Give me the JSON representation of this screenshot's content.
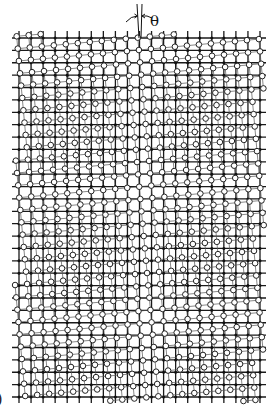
{
  "figure": {
    "angle_label": "θ",
    "panel_label_partial": ")",
    "colors": {
      "background": "#ffffff",
      "grid": "#1a1a1a",
      "circle_stroke": "#222222",
      "circle_fill": "#ffffff",
      "link": "#555555"
    }
  },
  "grid": {
    "columns": 21,
    "rows": 30,
    "origin_x": 19,
    "origin_y": 38,
    "spacing_x": 12.05,
    "spacing_y": 12.38,
    "line_overhang_left": 7,
    "line_overhang_right": 6,
    "line_overhang_top": 7,
    "line_overhang_bottom": 6
  },
  "rotated_lattice": {
    "rotation_deg": -5.2,
    "center_x": 140,
    "center_y": 217,
    "circle_radius": 2.8,
    "offset_x": 2.5,
    "offset_y": 0
  },
  "annotation": {
    "line1_top": [
      137,
      4
    ],
    "line1_bottom": [
      139,
      38
    ],
    "line2_top": [
      142,
      4
    ],
    "line2_bottom": [
      141,
      38
    ],
    "left_arrow_start": [
      126,
      22
    ],
    "right_arrow_start": [
      152,
      18
    ],
    "label_x": 150,
    "label_y": 26
  }
}
